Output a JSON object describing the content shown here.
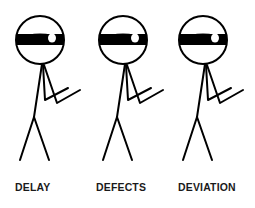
{
  "colors": {
    "background": "#ffffff",
    "stroke": "#000000",
    "label": "#1a1a1a"
  },
  "figures": [
    {
      "label": "DELAY",
      "icon": "stick-figure-masked-eye-icon",
      "head_center": [
        40,
        40
      ],
      "label_x": 15
    },
    {
      "label": "DEFECTS",
      "icon": "stick-figure-masked-eye-icon",
      "head_center": [
        123,
        40
      ],
      "label_x": 96
    },
    {
      "label": "DEVIATION",
      "icon": "stick-figure-masked-eye-icon",
      "head_center": [
        203,
        40
      ],
      "label_x": 178
    }
  ]
}
